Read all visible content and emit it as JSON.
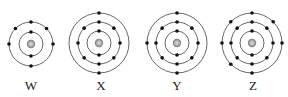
{
  "diagram": {
    "type": "bohr-models",
    "colors": {
      "shell": "#555555",
      "electron": "#111111",
      "nucleus_outer": "#9a9a9a",
      "nucleus_inner": "#d0d0d0"
    },
    "atoms": [
      {
        "label": "W",
        "cx": 31,
        "cy": 44,
        "shells": [
          {
            "r": 12,
            "electrons": 2
          },
          {
            "r": 22,
            "electrons": 6
          }
        ],
        "configuration": "2,6"
      },
      {
        "label": "X",
        "cx": 99,
        "cy": 43,
        "shells": [
          {
            "r": 12,
            "electrons": 2
          },
          {
            "r": 21,
            "electrons": 8
          },
          {
            "r": 30,
            "electrons": 2
          }
        ],
        "configuration": "2,8,2"
      },
      {
        "label": "Y",
        "cx": 177,
        "cy": 43,
        "shells": [
          {
            "r": 12,
            "electrons": 2
          },
          {
            "r": 21,
            "electrons": 8
          },
          {
            "r": 30,
            "electrons": 3
          }
        ],
        "configuration": "2,8,3"
      },
      {
        "label": "Z",
        "cx": 252,
        "cy": 43,
        "shells": [
          {
            "r": 12,
            "electrons": 2
          },
          {
            "r": 21,
            "electrons": 8
          },
          {
            "r": 30,
            "electrons": 7
          }
        ],
        "configuration": "2,8,7"
      }
    ]
  }
}
